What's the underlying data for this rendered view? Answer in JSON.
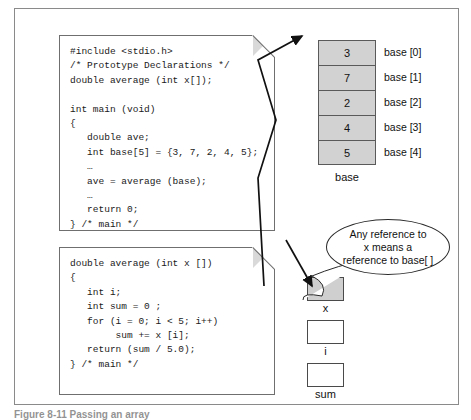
{
  "figure": {
    "caption": "Figure 8-11  Passing an array",
    "colors": {
      "cell_fill": "#d2d2d2",
      "sheet_border": "#6f6f6f",
      "frame_border": "#8a8a8a",
      "text": "#111111"
    }
  },
  "code_blocks": [
    {
      "id": "main",
      "name": "main-function-code",
      "text": "#include <stdio.h>\n/* Prototype Declarations */\ndouble average (int x[]);\n\nint main (void)\n{\n   double ave;\n   int base[5] = {3, 7, 2, 4, 5};\n   …\n   ave = average (base);\n   …\n   return 0;\n} /* main */"
    },
    {
      "id": "average",
      "name": "average-function-code",
      "text": "double average (int x [])\n{\n   int i;\n   int sum = 0 ;\n   for (i = 0; i < 5; i++)\n        sum += x [i];\n   return (sum / 5.0);\n} /* main */"
    }
  ],
  "array": {
    "name": "base",
    "cells": [
      {
        "value": "3",
        "label": "base [0]"
      },
      {
        "value": "7",
        "label": "base [1]"
      },
      {
        "value": "2",
        "label": "base [2]"
      },
      {
        "value": "4",
        "label": "base [3]"
      },
      {
        "value": "5",
        "label": "base [4]"
      }
    ]
  },
  "variables": [
    {
      "name": "x",
      "value": "",
      "filled": true
    },
    {
      "name": "i",
      "value": "",
      "filled": false
    },
    {
      "name": "sum",
      "value": "",
      "filled": false
    }
  ],
  "callout": {
    "line1": "Any reference to",
    "line2": "x  means a",
    "line3": "reference to base[ ]"
  }
}
